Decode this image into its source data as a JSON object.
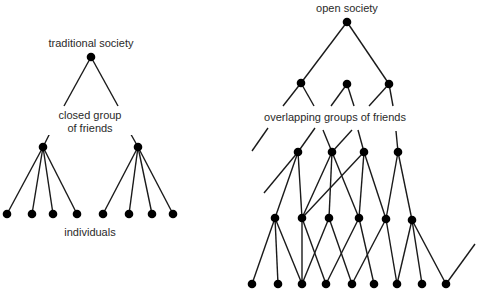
{
  "left_diagram": {
    "title": "traditional society",
    "middle_label_line1": "closed group",
    "middle_label_line2": "of friends",
    "bottom_label": "individuals",
    "nodes": {
      "root": [
        91,
        57
      ],
      "groups": [
        [
          43,
          147
        ],
        [
          138,
          147
        ]
      ],
      "individuals": [
        [
          7,
          214
        ],
        [
          32,
          214
        ],
        [
          53,
          214
        ],
        [
          77,
          214
        ],
        [
          103,
          214
        ],
        [
          129,
          214
        ],
        [
          152,
          214
        ],
        [
          173,
          214
        ]
      ]
    },
    "edges": [
      [
        [
          91,
          57
        ],
        [
          64,
          106
        ]
      ],
      [
        [
          52,
          129
        ],
        [
          43,
          147
        ]
      ],
      [
        [
          91,
          57
        ],
        [
          118,
          106
        ]
      ],
      [
        [
          128,
          129
        ],
        [
          138,
          147
        ]
      ],
      [
        [
          43,
          147
        ],
        [
          7,
          214
        ]
      ],
      [
        [
          43,
          147
        ],
        [
          32,
          214
        ]
      ],
      [
        [
          43,
          147
        ],
        [
          53,
          214
        ]
      ],
      [
        [
          43,
          147
        ],
        [
          77,
          214
        ]
      ],
      [
        [
          138,
          147
        ],
        [
          103,
          214
        ]
      ],
      [
        [
          138,
          147
        ],
        [
          129,
          214
        ]
      ],
      [
        [
          138,
          147
        ],
        [
          152,
          214
        ]
      ],
      [
        [
          138,
          147
        ],
        [
          173,
          214
        ]
      ]
    ]
  },
  "right_diagram": {
    "title": "open society",
    "middle_label": "overlapping groups of friends",
    "nodes": {
      "root": [
        347,
        22
      ],
      "level1": [
        [
          301,
          83
        ],
        [
          347,
          84
        ],
        [
          389,
          84
        ]
      ],
      "level2": [
        [
          298,
          152
        ],
        [
          332,
          152
        ],
        [
          364,
          152
        ],
        [
          398,
          152
        ]
      ],
      "level3": [
        [
          275,
          218
        ],
        [
          302,
          218
        ],
        [
          329,
          218
        ],
        [
          359,
          218
        ],
        [
          386,
          219
        ],
        [
          412,
          220
        ]
      ],
      "level4": [
        [
          252,
          284
        ],
        [
          278,
          284
        ],
        [
          302,
          284
        ],
        [
          326,
          284
        ],
        [
          352,
          284
        ],
        [
          374,
          284
        ],
        [
          397,
          284
        ],
        [
          422,
          284
        ],
        [
          446,
          284
        ]
      ]
    },
    "edges": [
      [
        [
          347,
          22
        ],
        [
          301,
          83
        ]
      ],
      [
        [
          347,
          22
        ],
        [
          389,
          84
        ]
      ],
      [
        [
          301,
          83
        ],
        [
          283,
          106
        ]
      ],
      [
        [
          268,
          128
        ],
        [
          252,
          151
        ]
      ],
      [
        [
          301,
          83
        ],
        [
          314,
          106
        ]
      ],
      [
        [
          323,
          130
        ],
        [
          332,
          152
        ]
      ],
      [
        [
          347,
          84
        ],
        [
          331,
          106
        ]
      ],
      [
        [
          315,
          128
        ],
        [
          298,
          152
        ]
      ],
      [
        [
          347,
          84
        ],
        [
          354,
          106
        ]
      ],
      [
        [
          358,
          130
        ],
        [
          364,
          152
        ]
      ],
      [
        [
          389,
          84
        ],
        [
          369,
          106
        ]
      ],
      [
        [
          352,
          130
        ],
        [
          332,
          152
        ]
      ],
      [
        [
          389,
          84
        ],
        [
          393,
          106
        ]
      ],
      [
        [
          396,
          131
        ],
        [
          398,
          152
        ]
      ],
      [
        [
          298,
          152
        ],
        [
          264,
          193
        ]
      ],
      [
        [
          298,
          152
        ],
        [
          275,
          218
        ]
      ],
      [
        [
          298,
          152
        ],
        [
          302,
          218
        ]
      ],
      [
        [
          332,
          152
        ],
        [
          302,
          218
        ]
      ],
      [
        [
          332,
          152
        ],
        [
          329,
          218
        ]
      ],
      [
        [
          332,
          152
        ],
        [
          359,
          218
        ]
      ],
      [
        [
          364,
          152
        ],
        [
          302,
          218
        ]
      ],
      [
        [
          364,
          152
        ],
        [
          359,
          218
        ]
      ],
      [
        [
          364,
          152
        ],
        [
          386,
          219
        ]
      ],
      [
        [
          398,
          152
        ],
        [
          386,
          219
        ]
      ],
      [
        [
          398,
          152
        ],
        [
          412,
          220
        ]
      ],
      [
        [
          275,
          218
        ],
        [
          252,
          284
        ]
      ],
      [
        [
          275,
          218
        ],
        [
          278,
          284
        ]
      ],
      [
        [
          275,
          218
        ],
        [
          302,
          284
        ]
      ],
      [
        [
          302,
          218
        ],
        [
          302,
          284
        ]
      ],
      [
        [
          302,
          218
        ],
        [
          326,
          284
        ]
      ],
      [
        [
          329,
          218
        ],
        [
          302,
          284
        ]
      ],
      [
        [
          329,
          218
        ],
        [
          352,
          284
        ]
      ],
      [
        [
          359,
          218
        ],
        [
          326,
          284
        ]
      ],
      [
        [
          359,
          218
        ],
        [
          374,
          284
        ]
      ],
      [
        [
          386,
          219
        ],
        [
          352,
          284
        ]
      ],
      [
        [
          386,
          219
        ],
        [
          397,
          284
        ]
      ],
      [
        [
          412,
          220
        ],
        [
          397,
          284
        ]
      ],
      [
        [
          412,
          220
        ],
        [
          422,
          284
        ]
      ],
      [
        [
          412,
          220
        ],
        [
          446,
          284
        ]
      ],
      [
        [
          446,
          284
        ],
        [
          475,
          244
        ]
      ]
    ]
  },
  "colors": {
    "background": "#ffffff",
    "line": "#1a1a1a",
    "node": "#000000",
    "text": "#2a2a2a"
  }
}
